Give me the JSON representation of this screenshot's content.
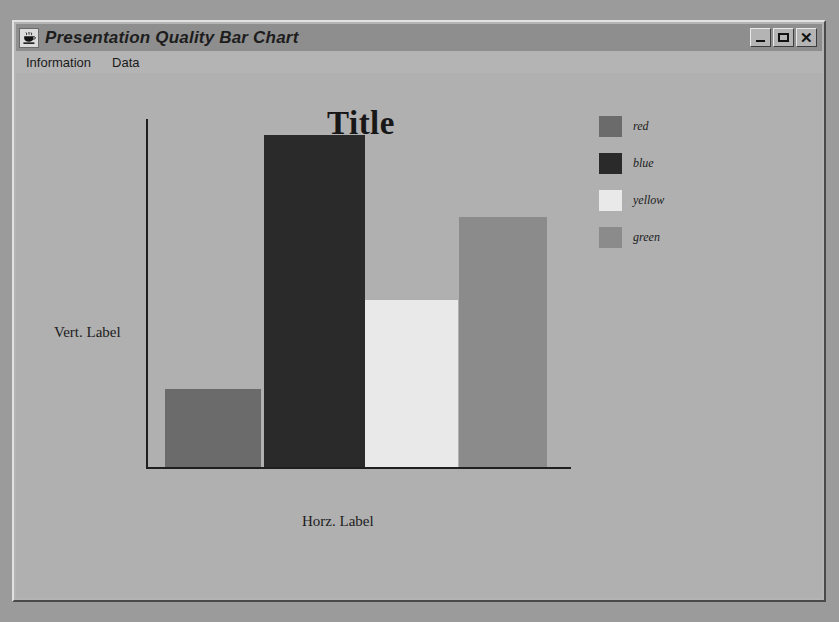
{
  "window": {
    "title": "Presentation Quality Bar Chart",
    "icon": "java-coffee-cup-icon",
    "buttons": {
      "minimize": "_",
      "maximize": "□",
      "close": "×"
    }
  },
  "menubar": {
    "items": [
      {
        "label": "Information"
      },
      {
        "label": "Data"
      }
    ]
  },
  "chart_data": {
    "type": "bar",
    "title": "Title",
    "xlabel": "Horz. Label",
    "ylabel": "Vert. Label",
    "categories": [
      "red",
      "blue",
      "yellow",
      "green"
    ],
    "values": [
      22,
      85,
      45,
      71
    ],
    "ylim": [
      0,
      100
    ],
    "grid": false,
    "axis_ticks": false,
    "legend": {
      "position": "right",
      "entries": [
        {
          "label": "red",
          "color": "#6b6b6b"
        },
        {
          "label": "blue",
          "color": "#2a2a2a"
        },
        {
          "label": "yellow",
          "color": "#e9e9e9"
        },
        {
          "label": "green",
          "color": "#8b8b8b"
        }
      ]
    },
    "bars": [
      {
        "label": "red",
        "color": "#6b6b6b",
        "left": 149,
        "width": 96,
        "height": 78
      },
      {
        "label": "blue",
        "color": "#2a2a2a",
        "left": 248,
        "width": 101,
        "height": 332
      },
      {
        "label": "yellow",
        "color": "#e9e9e9",
        "left": 349,
        "width": 93,
        "height": 167
      },
      {
        "label": "green",
        "color": "#8b8b8b",
        "left": 443,
        "width": 88,
        "height": 250
      }
    ]
  },
  "colors": {
    "desktop": "#9b9b9b",
    "window_face": "#b4b4b4",
    "titlebar": "#8e8e8e",
    "canvas": "#b0b0b0",
    "axis": "#1f1f1f"
  }
}
